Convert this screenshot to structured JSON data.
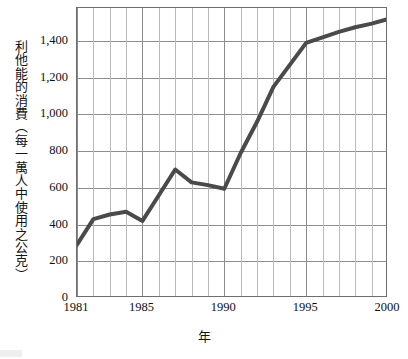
{
  "chart_data": {
    "type": "line",
    "title": "",
    "subtitle": "",
    "xlabel": "年",
    "ylabel": "利他能的消費（每一萬人中使用之公克）",
    "x": [
      1981,
      1982,
      1983,
      1984,
      1985,
      1986,
      1987,
      1988,
      1989,
      1990,
      1991,
      1992,
      1993,
      1994,
      1995,
      1996,
      1997,
      1998,
      1999,
      2000
    ],
    "values": [
      290,
      430,
      455,
      470,
      420,
      560,
      700,
      630,
      615,
      595,
      790,
      960,
      1150,
      1270,
      1390,
      1420,
      1450,
      1475,
      1495,
      1520
    ],
    "series": [
      {
        "name": "利他能的消費",
        "values": [
          290,
          430,
          455,
          470,
          420,
          560,
          700,
          630,
          615,
          595,
          790,
          960,
          1150,
          1270,
          1390,
          1420,
          1450,
          1475,
          1495,
          1520
        ]
      }
    ],
    "xlim": [
      1981,
      2000
    ],
    "ylim": [
      0,
      1580
    ],
    "xticks": [
      1981,
      1985,
      1990,
      1995,
      2000
    ],
    "xtick_labels": [
      "1981",
      "1985",
      "1990",
      "1995",
      "2000"
    ],
    "yticks": [
      0,
      200,
      400,
      600,
      800,
      1000,
      1200,
      1400
    ],
    "ytick_labels": [
      "0",
      "200",
      "400",
      "600",
      "800",
      "1,000",
      "1,200",
      "1,400"
    ],
    "grid": {
      "horizontal": true,
      "vertical": true,
      "vertical_every_year": true
    },
    "legend": {
      "visible": false,
      "position": "none"
    },
    "line_color": "#4a4a4a",
    "line_width": 4,
    "grid_color": "#b9b9b9",
    "axis_color": "#6e6e6e",
    "background_color": "#ffffff"
  }
}
